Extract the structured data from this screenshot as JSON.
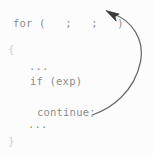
{
  "figure": {
    "kind": "code-control-flow-diagram",
    "background_color": "#fcfcfc",
    "ink_color": "#8d8d8d",
    "faint_ink_color": "#d2d2d2",
    "width": 153,
    "height": 156
  },
  "code": {
    "language": "c",
    "lines": [
      {
        "id": "for",
        "text": "for (   ;   ;   )"
      },
      {
        "id": "open",
        "text": "{"
      },
      {
        "id": "dots1",
        "text": "..."
      },
      {
        "id": "if",
        "text": "if (exp)"
      },
      {
        "id": "continue",
        "text": "continue;"
      },
      {
        "id": "dots2",
        "text": "..."
      },
      {
        "id": "close",
        "text": "}"
      }
    ]
  },
  "arrow": {
    "name": "continue-jump-arrow",
    "description": "curved arrow from the continue statement back up to the for-loop header",
    "color": "#6b6b6b",
    "from": "continue;",
    "to": "for (   ;   ;   )",
    "tail_point": [
      93,
      114
    ],
    "head_point": [
      107,
      11
    ],
    "bulge_x": 141
  }
}
